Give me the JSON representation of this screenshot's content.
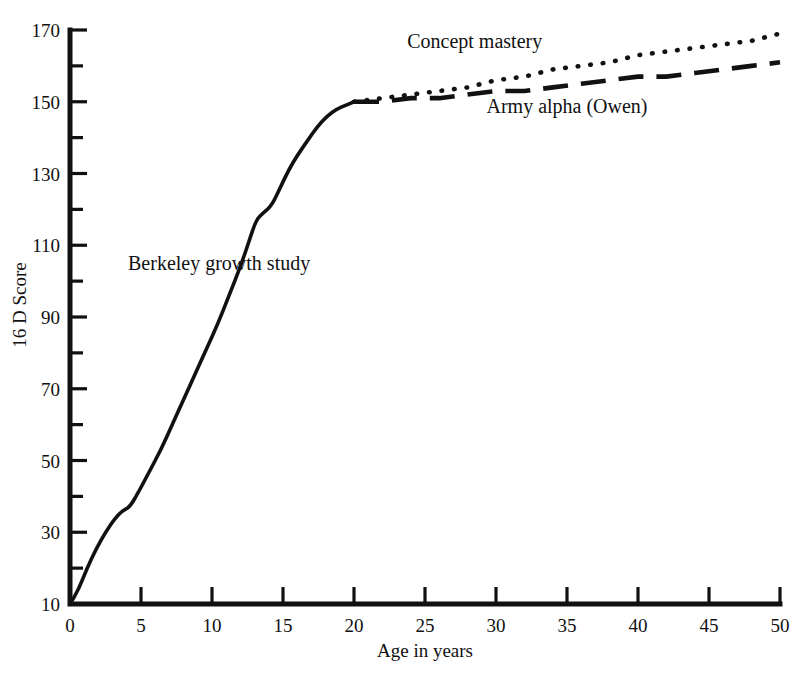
{
  "chart_data": {
    "type": "line",
    "title": "",
    "xlabel": "Age in years",
    "ylabel": "16 D Score",
    "xlim": [
      0,
      50
    ],
    "ylim": [
      10,
      170
    ],
    "grid": false,
    "legend_position": "inline-annotations",
    "x_ticks": [
      0,
      5,
      10,
      15,
      20,
      25,
      30,
      35,
      40,
      45,
      50
    ],
    "x_tick_labels": [
      "0",
      "5",
      "10",
      "15",
      "20",
      "25",
      "30",
      "35",
      "40",
      "45",
      "50"
    ],
    "y_ticks": [
      10,
      30,
      50,
      70,
      90,
      110,
      130,
      150,
      170
    ],
    "y_tick_labels": [
      "10",
      "30",
      "50",
      "70",
      "90",
      "110",
      "130",
      "150",
      "170"
    ],
    "y_minor_ticks": [
      20,
      40,
      60,
      80,
      100,
      120,
      140,
      160
    ],
    "series": [
      {
        "name": "Berkeley growth study",
        "style": "solid",
        "label_x": 10.5,
        "label_y": 103,
        "points": [
          [
            0.0,
            10
          ],
          [
            0.6,
            14
          ],
          [
            1.2,
            20
          ],
          [
            1.8,
            25
          ],
          [
            2.5,
            30
          ],
          [
            3.2,
            34
          ],
          [
            3.7,
            36
          ],
          [
            4.2,
            37
          ],
          [
            4.8,
            41
          ],
          [
            5.6,
            47
          ],
          [
            6.4,
            53
          ],
          [
            7.2,
            60
          ],
          [
            8.0,
            67
          ],
          [
            8.8,
            74
          ],
          [
            9.6,
            81
          ],
          [
            10.4,
            88
          ],
          [
            11.2,
            96
          ],
          [
            12.0,
            104
          ],
          [
            12.6,
            111
          ],
          [
            13.1,
            117
          ],
          [
            13.6,
            119
          ],
          [
            14.2,
            121
          ],
          [
            14.8,
            126
          ],
          [
            15.4,
            131
          ],
          [
            16.0,
            135
          ],
          [
            16.7,
            139
          ],
          [
            17.4,
            143
          ],
          [
            18.1,
            146
          ],
          [
            18.8,
            148
          ],
          [
            19.4,
            149
          ],
          [
            20.0,
            150
          ]
        ]
      },
      {
        "name": "Concept mastery",
        "style": "dotted",
        "label_x": 28.5,
        "label_y": 165,
        "points": [
          [
            20.0,
            150
          ],
          [
            22.0,
            151
          ],
          [
            24.0,
            152
          ],
          [
            26.0,
            153
          ],
          [
            28.0,
            154
          ],
          [
            30.0,
            156
          ],
          [
            32.0,
            157
          ],
          [
            34.0,
            159
          ],
          [
            36.0,
            160
          ],
          [
            38.0,
            161
          ],
          [
            40.0,
            163
          ],
          [
            42.0,
            164
          ],
          [
            44.0,
            165
          ],
          [
            46.0,
            166
          ],
          [
            48.0,
            167
          ],
          [
            50.0,
            169
          ]
        ]
      },
      {
        "name": "Army alpha (Owen)",
        "style": "dashed",
        "label_x": 35.0,
        "label_y": 147,
        "points": [
          [
            20.0,
            150
          ],
          [
            22.0,
            150
          ],
          [
            24.0,
            151
          ],
          [
            26.0,
            151
          ],
          [
            28.0,
            152
          ],
          [
            30.0,
            153
          ],
          [
            32.0,
            153
          ],
          [
            34.0,
            154
          ],
          [
            36.0,
            155
          ],
          [
            38.0,
            156
          ],
          [
            40.0,
            157
          ],
          [
            42.0,
            157
          ],
          [
            44.0,
            158
          ],
          [
            46.0,
            159
          ],
          [
            48.0,
            160
          ],
          [
            50.0,
            161
          ]
        ]
      }
    ]
  }
}
